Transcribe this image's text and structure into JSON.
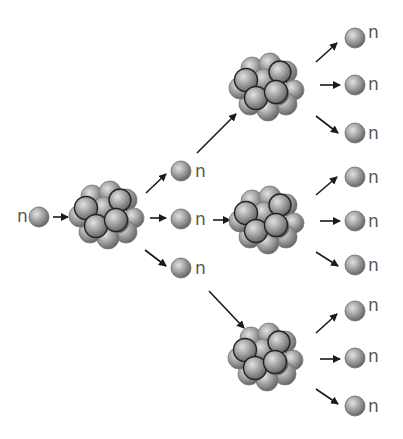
{
  "diagram": {
    "neutron_label": "n",
    "colors": {
      "particle": "#8a8a8a",
      "particle_highlight": "#d8d8d8",
      "outline": "#2a2a2a",
      "arrow": "#1a1a1a",
      "label": "#555555"
    },
    "incoming_neutron": {
      "label": "n"
    },
    "generation_1": {
      "nucleus": "nucleus-1",
      "released_neutrons": [
        {
          "label": "n"
        },
        {
          "label": "n"
        },
        {
          "label": "n"
        }
      ]
    },
    "generation_2": [
      {
        "nucleus": "nucleus-2a",
        "released_neutrons": [
          {
            "label": "n"
          },
          {
            "label": "n"
          },
          {
            "label": "n"
          }
        ]
      },
      {
        "nucleus": "nucleus-2b",
        "released_neutrons": [
          {
            "label": "n"
          },
          {
            "label": "n"
          },
          {
            "label": "n"
          }
        ]
      },
      {
        "nucleus": "nucleus-2c",
        "released_neutrons": [
          {
            "label": "n"
          },
          {
            "label": "n"
          },
          {
            "label": "n"
          }
        ]
      }
    ]
  }
}
